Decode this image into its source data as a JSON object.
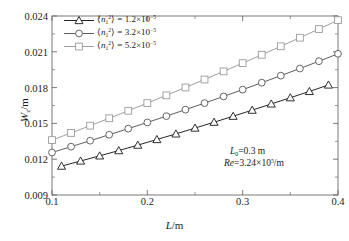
{
  "chart_data": {
    "type": "line",
    "title": "",
    "xlabel": "L /m",
    "ylabel": "W_z /m",
    "xlim": [
      0.1,
      0.4
    ],
    "ylim": [
      0.009,
      0.024
    ],
    "xticks": [
      "0.1",
      "0.2",
      "0.3",
      "0.4"
    ],
    "xtick_values": [
      0.1,
      0.2,
      0.3,
      0.4
    ],
    "yticks": [
      "0.009",
      "0.012",
      "0.015",
      "0.018",
      "0.021",
      "0.024"
    ],
    "ytick_values": [
      0.009,
      0.012,
      0.015,
      0.018,
      0.021,
      0.024
    ],
    "grid": false,
    "legend_position": "upper-left",
    "series": [
      {
        "name": "<n1^2> = 1.2e-5",
        "marker": "triangle",
        "color": "#1a1a1a",
        "x": [
          0.11,
          0.13,
          0.15,
          0.17,
          0.19,
          0.21,
          0.23,
          0.25,
          0.27,
          0.29,
          0.31,
          0.33,
          0.35,
          0.37,
          0.39
        ],
        "y": [
          0.01142,
          0.01185,
          0.01228,
          0.01272,
          0.01318,
          0.01365,
          0.01412,
          0.01461,
          0.0151,
          0.0156,
          0.01611,
          0.01663,
          0.01715,
          0.01768,
          0.01822
        ]
      },
      {
        "name": "<n1^2> = 3.2e-5",
        "marker": "circle",
        "color": "#555555",
        "x": [
          0.1,
          0.12,
          0.14,
          0.16,
          0.18,
          0.2,
          0.22,
          0.24,
          0.26,
          0.28,
          0.3,
          0.32,
          0.34,
          0.36,
          0.38,
          0.4
        ],
        "y": [
          0.01256,
          0.01305,
          0.01355,
          0.01405,
          0.01456,
          0.01508,
          0.01561,
          0.01615,
          0.0167,
          0.01726,
          0.01783,
          0.01841,
          0.019,
          0.0196,
          0.02021,
          0.02083
        ]
      },
      {
        "name": "<n1^2> = 5.2e-5",
        "marker": "square",
        "color": "#9a9a9a",
        "x": [
          0.1,
          0.12,
          0.14,
          0.16,
          0.18,
          0.2,
          0.22,
          0.24,
          0.26,
          0.28,
          0.3,
          0.32,
          0.34,
          0.36,
          0.38,
          0.4
        ],
        "y": [
          0.0136,
          0.0142,
          0.01481,
          0.01543,
          0.01606,
          0.0167,
          0.01735,
          0.01801,
          0.01868,
          0.01936,
          0.02005,
          0.02075,
          0.02146,
          0.02218,
          0.02291,
          0.02365
        ]
      }
    ],
    "annotations": [
      {
        "id": "L0",
        "text_plain": "L0=0.3 m"
      },
      {
        "id": "Re",
        "text_plain": "Re=3.24x10^5 /m"
      }
    ]
  },
  "axes": {
    "y_label_main": "W",
    "y_label_sub": "z",
    "y_label_unit": "/m",
    "x_label_main": "L",
    "x_label_unit": "/m"
  },
  "legend": {
    "items": [
      {
        "symbol": "n",
        "sub": "1",
        "sup": "2",
        "equals": "=",
        "mantissa": "1.2",
        "times": "×",
        "base": "10",
        "exponent": "−5",
        "marker": "triangle",
        "color": "#1a1a1a"
      },
      {
        "symbol": "n",
        "sub": "1",
        "sup": "2",
        "equals": "=",
        "mantissa": "3.2",
        "times": "×",
        "base": "10",
        "exponent": "−5",
        "marker": "circle",
        "color": "#555555"
      },
      {
        "symbol": "n",
        "sub": "1",
        "sup": "2",
        "equals": "=",
        "mantissa": "5.2",
        "times": "×",
        "base": "10",
        "exponent": "−5",
        "marker": "square",
        "color": "#9a9a9a"
      }
    ]
  },
  "annotations": {
    "line1": {
      "symbol": "L",
      "sub": "0",
      "rest": "=0.3 m"
    },
    "line2": {
      "symbol": "Re",
      "eq": "=3.24",
      "times": "×",
      "base": "10",
      "exponent": "5",
      "unit": "/m"
    }
  },
  "colors": {
    "axis": "#6b6b6b",
    "series1": "#1a1a1a",
    "series2": "#555555",
    "series3": "#9a9a9a",
    "background": "#ffffff",
    "text": "#1a1a1a"
  }
}
